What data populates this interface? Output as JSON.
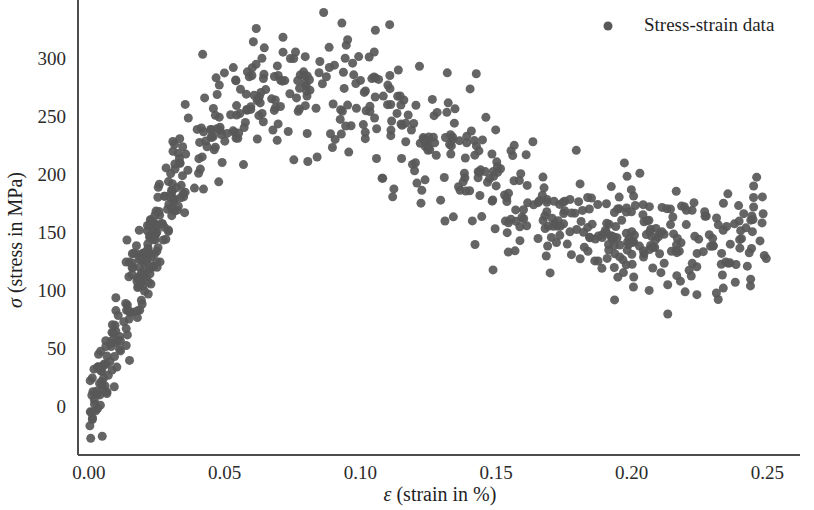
{
  "chart_data": {
    "type": "scatter",
    "title": "",
    "xlabel": "ε (strain in %)",
    "ylabel": "σ (stress in MPa)",
    "xlabel_symbol": "ε",
    "xlabel_rest": " (strain in %)",
    "ylabel_symbol": "σ",
    "ylabel_rest": " (stress in MPa)",
    "xlim": [
      -0.004,
      0.262
    ],
    "ylim": [
      -42,
      345
    ],
    "xticks": [
      0.0,
      0.05,
      0.1,
      0.15,
      0.2,
      0.25
    ],
    "xticklabels": [
      "0.00",
      "0.05",
      "0.10",
      "0.15",
      "0.20",
      "0.25"
    ],
    "yticks": [
      0,
      50,
      100,
      150,
      200,
      250,
      300
    ],
    "yticklabels": [
      "0",
      "50",
      "100",
      "150",
      "200",
      "250",
      "300"
    ],
    "grid": false,
    "legend_position": "top-right",
    "marker": {
      "shape": "circle",
      "color": "#585858",
      "size": 9,
      "opacity": 0.92
    },
    "series": [
      {
        "name": "Stress-strain data",
        "color": "#585858",
        "n_points": 760,
        "description": "Engineering stress-strain curve with noisy scatter: steep elastic rise from ~0 to ~0.03 strain, yield/strain-hardening plateau peaking near 275 MPa around 0.06-0.09 strain, then necking decline to a ~145 MPa plateau from 0.17 to 0.25 strain.",
        "model": {
          "type": "piecewise-mean-with-gaussian-noise",
          "noise_sigma": 26,
          "knots_x": [
            0.0,
            0.005,
            0.01,
            0.015,
            0.02,
            0.025,
            0.03,
            0.035,
            0.04,
            0.05,
            0.06,
            0.07,
            0.08,
            0.09,
            0.1,
            0.11,
            0.12,
            0.13,
            0.14,
            0.15,
            0.16,
            0.17,
            0.18,
            0.19,
            0.2,
            0.21,
            0.22,
            0.23,
            0.24,
            0.25
          ],
          "knots_y": [
            0,
            30,
            62,
            92,
            120,
            150,
            182,
            208,
            228,
            252,
            266,
            273,
            274,
            270,
            260,
            248,
            238,
            222,
            205,
            190,
            172,
            160,
            152,
            148,
            146,
            144,
            143,
            143,
            144,
            145
          ]
        }
      }
    ],
    "legend": [
      {
        "label": "Stress-strain data",
        "marker": "circle",
        "color": "#585858"
      }
    ],
    "axis_color": "#4d4d4d",
    "background_color": "#ffffff",
    "spines_visible": [
      "left",
      "bottom"
    ]
  },
  "legend": {
    "entries": [
      {
        "label": "Stress-strain data"
      }
    ]
  },
  "axes": {
    "x_title_symbol": "ε",
    "x_title_rest": " (strain in %)",
    "y_title_symbol": "σ",
    "y_title_rest": " (stress in MPa)",
    "x_tick_labels": [
      "0.00",
      "0.05",
      "0.10",
      "0.15",
      "0.20",
      "0.25"
    ],
    "y_tick_labels": [
      "0",
      "50",
      "100",
      "150",
      "200",
      "250",
      "300"
    ]
  }
}
